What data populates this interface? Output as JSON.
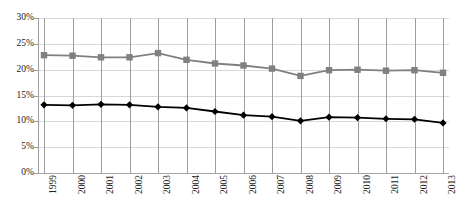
{
  "chart_data": {
    "type": "line",
    "title": "",
    "subtitle": "",
    "xlabel": "",
    "ylabel": "",
    "categories": [
      "1999",
      "2000",
      "2001",
      "2002",
      "2003",
      "2004",
      "2005",
      "2006",
      "2007",
      "2008",
      "2009",
      "2010",
      "2011",
      "2012",
      "2013"
    ],
    "ylim": [
      0,
      30
    ],
    "ytick_labels": [
      "0%",
      "5%",
      "10%",
      "15%",
      "20%",
      "25%",
      "30%"
    ],
    "ytick_values": [
      0,
      5,
      10,
      15,
      20,
      25,
      30
    ],
    "grid": true,
    "legend": "none",
    "series": [
      {
        "name": "upper-series",
        "marker": "square",
        "color": "#808080",
        "values": [
          22.8,
          22.7,
          22.4,
          22.4,
          23.2,
          21.9,
          21.2,
          20.8,
          20.2,
          18.8,
          19.9,
          20.0,
          19.8,
          19.9,
          19.4
        ]
      },
      {
        "name": "lower-series",
        "marker": "diamond",
        "color": "#000000",
        "values": [
          13.2,
          13.1,
          13.3,
          13.2,
          12.8,
          12.6,
          11.9,
          11.2,
          10.9,
          10.1,
          10.8,
          10.7,
          10.5,
          10.4,
          9.7
        ]
      }
    ]
  },
  "axis": {
    "gridline_color": "#d9d9d9",
    "axis_color": "#9d9d9d"
  }
}
